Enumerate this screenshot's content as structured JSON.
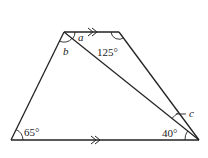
{
  "diagram": {
    "type": "trapezium-with-diagonal",
    "vertices": {
      "top_left": [
        64,
        32
      ],
      "top_right": [
        119,
        32
      ],
      "bottom_left": [
        11,
        140
      ],
      "bottom_right": [
        199,
        140
      ]
    },
    "parallel_marks": "double-arrow on top and bottom sides",
    "labels": {
      "a": "a",
      "b": "b",
      "c": "c",
      "angle_top_right": "125°",
      "angle_bottom_left": "65°",
      "angle_bottom_right": "40°"
    },
    "colors": {
      "stroke": "#222222",
      "background": "#ffffff"
    }
  }
}
